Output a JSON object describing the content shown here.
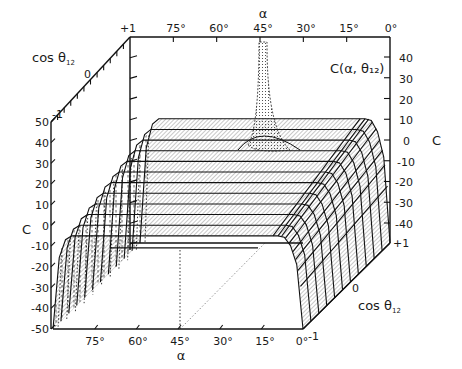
{
  "chart_data": {
    "type": "surface3d",
    "title": "C(α, θ₁₂)",
    "function_label": "C(α, θ₁₂)",
    "axes": {
      "alpha": {
        "label": "α",
        "ticks": [
          "75°",
          "60°",
          "45°",
          "30°",
          "15°",
          "0°"
        ],
        "tick_values": [
          75,
          60,
          45,
          30,
          15,
          0
        ],
        "range": [
          90,
          0
        ]
      },
      "cos_theta": {
        "label": "cos θ₁₂",
        "label_main": "cos θ",
        "label_sub": "12",
        "ticks": [
          "+1",
          "0",
          "-1"
        ],
        "tick_values": [
          1,
          0,
          -1
        ],
        "range": [
          -1,
          1
        ]
      },
      "C_left": {
        "label": "C",
        "ticks": [
          "50",
          "40",
          "30",
          "20",
          "10",
          "0",
          "-10",
          "-20",
          "-30",
          "-40",
          "-50"
        ],
        "tick_values": [
          50,
          40,
          30,
          20,
          10,
          0,
          -10,
          -20,
          -30,
          -40,
          -50
        ],
        "range": [
          -50,
          50
        ]
      },
      "C_right": {
        "label": "C",
        "ticks": [
          "40",
          "30",
          "20",
          "10",
          "0",
          "-10",
          "-20",
          "-30",
          "-40"
        ],
        "tick_values": [
          40,
          30,
          20,
          10,
          0,
          -10,
          -20,
          -30,
          -40
        ]
      }
    },
    "surface": {
      "description": "Plateau surface; near-constant C across α with rounded drop-off toward α→0° and α→90°, and a sharp spike at α=45°, cos θ₁₂=+1",
      "plateau_C_front_edge": -5,
      "plateau_C_back_edge": 10,
      "spike_alpha": 45,
      "spike_cos_theta": 1,
      "spike_C_peak": 50,
      "edge_C_min": -50,
      "mesh_lines_alpha": 12,
      "mesh_lines_cos_theta": 11
    },
    "corner_labels": {
      "top_left": "+1",
      "left_top": "-1",
      "bottom_right_corner": "-1",
      "right_bottom": "+1",
      "right_zero": "0",
      "depth_zero_back": "0"
    }
  }
}
